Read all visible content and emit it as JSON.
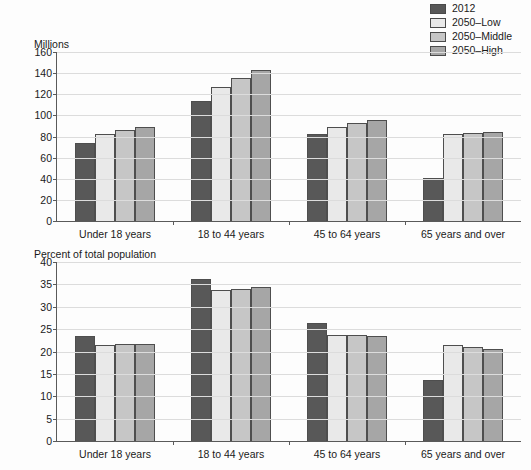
{
  "legend": {
    "items": [
      {
        "label": "2012",
        "color": "#585858"
      },
      {
        "label": "2050–Low",
        "color": "#e9e9e9"
      },
      {
        "label": "2050–Middle",
        "color": "#c6c6c6"
      },
      {
        "label": "2050–High",
        "color": "#a6a6a6"
      }
    ]
  },
  "caption": {
    "text": ""
  },
  "chart_data": [
    {
      "type": "bar",
      "title": "",
      "ylabel": "Millions",
      "xlabel": "",
      "ylim": [
        0,
        160
      ],
      "yticks": [
        0,
        20,
        40,
        60,
        80,
        100,
        120,
        140,
        160
      ],
      "grid": true,
      "legend_position": "top-right",
      "categories": [
        "Under 18 years",
        "18 to 44 years",
        "45 to 64 years",
        "65 years and over"
      ],
      "series": [
        {
          "name": "2012",
          "color": "#585858",
          "values": [
            74,
            114,
            82,
            41
          ]
        },
        {
          "name": "2050–Low",
          "color": "#e9e9e9",
          "values": [
            82,
            127,
            89,
            82
          ]
        },
        {
          "name": "2050–Middle",
          "color": "#c6c6c6",
          "values": [
            86,
            135,
            93,
            83
          ]
        },
        {
          "name": "2050–High",
          "color": "#a6a6a6",
          "values": [
            89,
            143,
            96,
            84
          ]
        }
      ]
    },
    {
      "type": "bar",
      "title": "",
      "ylabel": "Percent of total population",
      "xlabel": "",
      "ylim": [
        0,
        40
      ],
      "yticks": [
        0,
        5,
        10,
        15,
        20,
        25,
        30,
        35,
        40
      ],
      "grid": true,
      "legend_position": "top-right",
      "categories": [
        "Under 18 years",
        "18 to 44 years",
        "45 to 64 years",
        "65 years and over"
      ],
      "series": [
        {
          "name": "2012",
          "color": "#585858",
          "values": [
            23.5,
            36.3,
            26.4,
            13.7
          ]
        },
        {
          "name": "2050–Low",
          "color": "#e9e9e9",
          "values": [
            21.5,
            33.7,
            23.7,
            21.5
          ]
        },
        {
          "name": "2050–Middle",
          "color": "#c6c6c6",
          "values": [
            21.6,
            34.0,
            23.6,
            21.0
          ]
        },
        {
          "name": "2050–High",
          "color": "#a6a6a6",
          "values": [
            21.7,
            34.5,
            23.4,
            20.6
          ]
        }
      ]
    }
  ]
}
